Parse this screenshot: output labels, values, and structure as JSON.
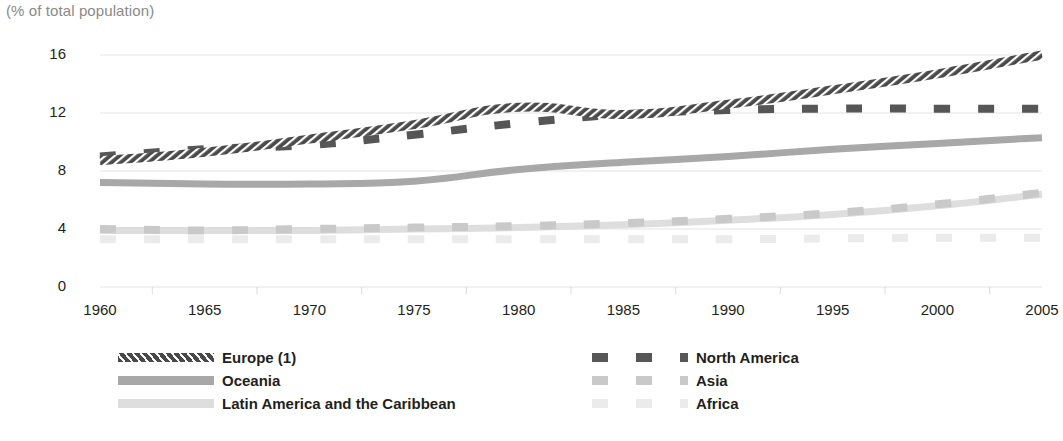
{
  "chart_data": {
    "type": "line",
    "title": "",
    "subtitle": "(% of total population)",
    "ylabel": "(% of total population)",
    "xlabel": "",
    "x": [
      1960,
      1965,
      1970,
      1975,
      1980,
      1985,
      1990,
      1995,
      2000,
      2005
    ],
    "xlim": [
      1960,
      2005
    ],
    "ylim": [
      0,
      16
    ],
    "yticks": [
      0,
      4,
      8,
      12,
      16
    ],
    "xticks": [
      1960,
      1965,
      1970,
      1975,
      1980,
      1985,
      1990,
      1995,
      2000,
      2005
    ],
    "grid": "horizontal",
    "legend_position": "bottom",
    "series": [
      {
        "name": "Europe (1)",
        "color": "#4a4a4a",
        "style": "hatched",
        "values": [
          8.7,
          9.3,
          10.2,
          11.2,
          12.4,
          11.9,
          12.6,
          13.6,
          14.7,
          16.0
        ]
      },
      {
        "name": "North America",
        "color": "#565656",
        "style": "dashed",
        "values": [
          9.0,
          9.5,
          9.8,
          10.5,
          11.3,
          11.9,
          12.2,
          12.3,
          12.3,
          12.3
        ]
      },
      {
        "name": "Oceania",
        "color": "#a8a8a8",
        "style": "solid",
        "values": [
          7.2,
          7.1,
          7.1,
          7.3,
          8.1,
          8.6,
          9.0,
          9.5,
          9.9,
          10.3
        ]
      },
      {
        "name": "Asia",
        "color": "#c9c9c9",
        "style": "dashed",
        "values": [
          4.0,
          3.9,
          4.0,
          4.1,
          4.2,
          4.4,
          4.7,
          5.1,
          5.7,
          6.5
        ]
      },
      {
        "name": "Latin America and the Caribbean",
        "color": "#dedede",
        "style": "solid",
        "values": [
          3.9,
          3.9,
          3.9,
          4.0,
          4.1,
          4.3,
          4.6,
          5.0,
          5.6,
          6.4
        ]
      },
      {
        "name": "Africa",
        "color": "#ebebeb",
        "style": "dashed",
        "values": [
          3.3,
          3.3,
          3.3,
          3.3,
          3.3,
          3.3,
          3.3,
          3.35,
          3.4,
          3.4
        ]
      }
    ]
  },
  "legend": {
    "left": [
      {
        "label": "Europe (1)",
        "color": "#4a4a4a",
        "style": "hatched"
      },
      {
        "label": "Oceania",
        "color": "#a8a8a8",
        "style": "solid"
      },
      {
        "label": "Latin America and the Caribbean",
        "color": "#dedede",
        "style": "solid"
      }
    ],
    "right": [
      {
        "label": "North America",
        "color": "#565656",
        "style": "dashed"
      },
      {
        "label": "Asia",
        "color": "#c9c9c9",
        "style": "dashed"
      },
      {
        "label": "Africa",
        "color": "#ebebeb",
        "style": "dashed"
      }
    ]
  },
  "axes": {
    "y_labels": [
      "16",
      "12",
      "8",
      "4",
      "0"
    ],
    "x_labels": [
      "1960",
      "1965",
      "1970",
      "1975",
      "1980",
      "1985",
      "1990",
      "1995",
      "2000",
      "2005"
    ],
    "note": "(% of total population)"
  },
  "colors": {
    "grid": "#e3e3e3",
    "text": "#231f20",
    "note": "#8a8a8a"
  }
}
